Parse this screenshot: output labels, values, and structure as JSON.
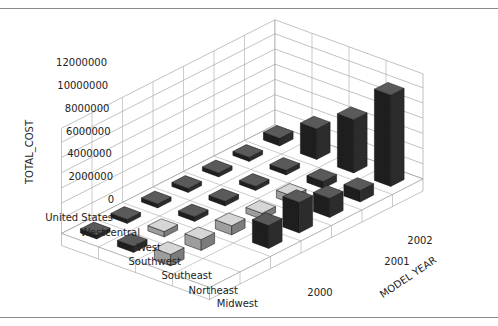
{
  "chart_data": {
    "type": "bar3d",
    "title": "",
    "zlabel": "TOTAL_COST",
    "xlabel": "MODEL YEAR",
    "ylabel": "",
    "z_ticks": [
      "0",
      "2000000",
      "4000000",
      "6000000",
      "8000000",
      "10000000",
      "12000000"
    ],
    "zlim": [
      0,
      12000000
    ],
    "regions": [
      "United States",
      "Westcentral",
      "West",
      "Southwest",
      "Southeast",
      "Northeast",
      "Midwest"
    ],
    "years": [
      "2000",
      "2001",
      "2002"
    ],
    "series": [
      {
        "name": "United States",
        "values": [
          1000000,
          4000000,
          7000000,
          12000000
        ]
      },
      {
        "name": "Westcentral",
        "values": [
          300000,
          600000,
          900000,
          1500000
        ]
      },
      {
        "name": "West",
        "values": [
          300000,
          500000,
          1000000,
          2500000
        ]
      },
      {
        "name": "Southwest",
        "values": [
          300000,
          600000,
          800000,
          4000000
        ]
      },
      {
        "name": "Southeast",
        "values": [
          400000,
          600000,
          1200000,
          3000000
        ]
      },
      {
        "name": "Northeast",
        "values": [
          300000,
          700000,
          1400000
        ]
      },
      {
        "name": "Midwest",
        "values": [
          400000,
          800000,
          1500000
        ]
      }
    ],
    "grid": true,
    "legend": false
  },
  "labels": {
    "z_title": "TOTAL_COST",
    "x_title": "MODEL YEAR"
  }
}
